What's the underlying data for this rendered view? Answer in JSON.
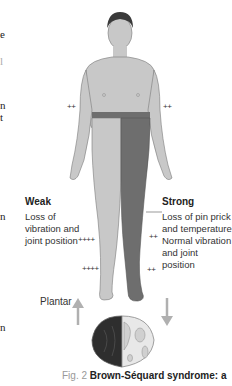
{
  "left_column_fragments": [
    "e",
    "l",
    "n",
    "t",
    "n",
    "n"
  ],
  "figure": {
    "left_label": {
      "heading": "Weak",
      "lines": [
        "Loss of",
        "vibration and",
        "joint position"
      ]
    },
    "right_label": {
      "heading": "Strong",
      "lines": [
        "Loss of pin prick",
        "and temperature",
        "Normal vibration",
        "and joint position"
      ]
    },
    "reflex_marks": {
      "left_arm": "++",
      "right_arm": "++",
      "left_knee": "++++",
      "left_ankle": "++++",
      "right_knee": "++",
      "right_ankle": "++"
    },
    "plantar_label": "Plantar",
    "plantar_left": "up",
    "plantar_right": "down",
    "colors": {
      "body": "#c8c8c8",
      "affected": "#6e6e6e",
      "outline": "#7a7a7a",
      "arrow": "#b0b0b0"
    }
  },
  "caption": {
    "prefix": "Fig. 2",
    "title": "Brown-Séquard syndrome: a"
  }
}
